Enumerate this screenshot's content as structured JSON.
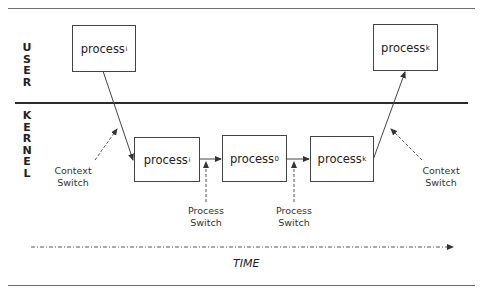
{
  "layers": {
    "user": "USER",
    "kernel": "KERNEL"
  },
  "user_processes": [
    {
      "name": "process",
      "subscript": "i"
    },
    {
      "name": "process",
      "subscript": "k"
    }
  ],
  "kernel_processes": [
    {
      "name": "process",
      "subscript": "i"
    },
    {
      "name": "process",
      "subscript": "0"
    },
    {
      "name": "process",
      "subscript": "k"
    }
  ],
  "annotations": {
    "context_switch_left": [
      "Context",
      "Switch"
    ],
    "context_switch_right": [
      "Context",
      "Switch"
    ],
    "process_switch_1": [
      "Process",
      "Switch"
    ],
    "process_switch_2": [
      "Process",
      "Switch"
    ]
  },
  "time_axis": {
    "label": "TIME"
  },
  "colors": {
    "line": "#444444",
    "divider": "#2b2b2b",
    "text": "#222222"
  }
}
